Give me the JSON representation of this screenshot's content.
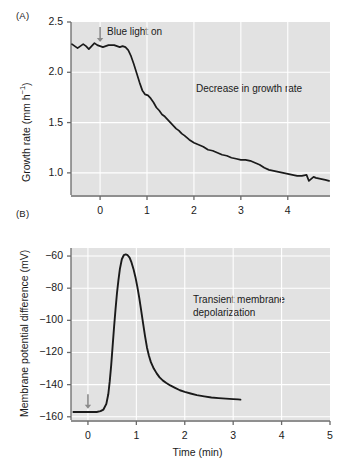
{
  "figure": {
    "panel_a_label": "(A)",
    "panel_b_label": "(B)",
    "shared_xlabel": "Time (min)"
  },
  "chart_data": [
    {
      "type": "line",
      "panel": "(A)",
      "title": "",
      "xlabel": "",
      "ylabel": "Growth rate (mm h−1)",
      "ylabel_display": "Growth rate (mm h",
      "ylabel_sup": "−1",
      "ylabel_tail": ")",
      "xlim": [
        -0.62,
        4.9
      ],
      "ylim": [
        0.78,
        2.5
      ],
      "xticks": [
        0,
        1,
        2,
        3,
        4
      ],
      "xticklabels": [
        "0",
        "1",
        "2",
        "3",
        "4"
      ],
      "yticks": [
        1.0,
        1.5,
        2.0,
        2.5
      ],
      "yticklabels": [
        "1.0",
        "1.5",
        "2.0",
        "2.5"
      ],
      "grid": true,
      "grid_color": "#ffffff",
      "plot_bg": "#e2e2e2",
      "line_color": "#1a1a1a",
      "annotations": [
        {
          "text": "Blue light on",
          "x": 0.08,
          "y": 2.42
        },
        {
          "text": "Decrease in growth rate",
          "x": 2.0,
          "y": 1.78
        }
      ],
      "arrow": {
        "x": 0.0,
        "y_top": 2.45,
        "y_bottom": 2.3,
        "color": "#8a8a8a"
      },
      "x": [
        -0.6,
        -0.54,
        -0.48,
        -0.42,
        -0.36,
        -0.3,
        -0.24,
        -0.18,
        -0.12,
        -0.06,
        0.0,
        0.06,
        0.12,
        0.18,
        0.24,
        0.3,
        0.36,
        0.42,
        0.48,
        0.54,
        0.6,
        0.66,
        0.72,
        0.78,
        0.84,
        0.9,
        0.96,
        1.02,
        1.08,
        1.14,
        1.2,
        1.26,
        1.32,
        1.38,
        1.44,
        1.5,
        1.56,
        1.62,
        1.68,
        1.74,
        1.8,
        1.9,
        2.0,
        2.1,
        2.2,
        2.3,
        2.4,
        2.5,
        2.6,
        2.7,
        2.8,
        2.9,
        3.0,
        3.1,
        3.2,
        3.3,
        3.4,
        3.5,
        3.6,
        3.7,
        3.8,
        3.9,
        4.0,
        4.1,
        4.2,
        4.3,
        4.4,
        4.45,
        4.5,
        4.55,
        4.6,
        4.7,
        4.8,
        4.88
      ],
      "y": [
        2.28,
        2.26,
        2.24,
        2.26,
        2.28,
        2.26,
        2.23,
        2.26,
        2.29,
        2.27,
        2.26,
        2.25,
        2.26,
        2.27,
        2.27,
        2.27,
        2.26,
        2.25,
        2.26,
        2.25,
        2.22,
        2.16,
        2.08,
        1.99,
        1.9,
        1.82,
        1.78,
        1.77,
        1.74,
        1.7,
        1.65,
        1.62,
        1.58,
        1.56,
        1.53,
        1.5,
        1.47,
        1.44,
        1.42,
        1.39,
        1.37,
        1.33,
        1.3,
        1.28,
        1.26,
        1.23,
        1.22,
        1.2,
        1.18,
        1.17,
        1.15,
        1.14,
        1.13,
        1.13,
        1.12,
        1.1,
        1.08,
        1.05,
        1.03,
        1.02,
        1.01,
        1.0,
        0.99,
        0.98,
        0.97,
        0.97,
        0.98,
        0.92,
        0.94,
        0.96,
        0.95,
        0.94,
        0.93,
        0.92
      ]
    },
    {
      "type": "line",
      "panel": "(B)",
      "title": "",
      "xlabel": "Time (min)",
      "ylabel": "Membrane potential difference (mV)",
      "xlim": [
        -0.35,
        5.0
      ],
      "ylim": [
        -162,
        -55
      ],
      "xticks": [
        0,
        1,
        2,
        3,
        4,
        5
      ],
      "xticklabels": [
        "0",
        "1",
        "2",
        "3",
        "4",
        "5"
      ],
      "yticks": [
        -160,
        -140,
        -120,
        -100,
        -80,
        -60
      ],
      "yticklabels": [
        "−160",
        "−140",
        "−120",
        "−100",
        "−80",
        "−60"
      ],
      "grid": true,
      "grid_color": "#ffffff",
      "plot_bg": "#e2e2e2",
      "line_color": "#1a1a1a",
      "annotations": [
        {
          "text": "Transient membrane\ndepolarization",
          "x": 1.9,
          "y": -88
        }
      ],
      "arrow": {
        "x": 0.0,
        "y_top": -146,
        "y_bottom": -155,
        "color": "#8a8a8a"
      },
      "x": [
        -0.3,
        -0.22,
        -0.14,
        -0.06,
        0.02,
        0.1,
        0.18,
        0.26,
        0.32,
        0.38,
        0.42,
        0.45,
        0.48,
        0.51,
        0.54,
        0.57,
        0.6,
        0.63,
        0.66,
        0.7,
        0.74,
        0.78,
        0.82,
        0.86,
        0.9,
        0.94,
        0.98,
        1.02,
        1.06,
        1.1,
        1.14,
        1.18,
        1.22,
        1.26,
        1.3,
        1.36,
        1.42,
        1.48,
        1.55,
        1.62,
        1.7,
        1.8,
        1.9,
        2.0,
        2.12,
        2.25,
        2.4,
        2.55,
        2.7,
        2.85,
        3.0,
        3.1,
        3.15
      ],
      "y": [
        -157,
        -157,
        -157,
        -157,
        -157,
        -157,
        -157,
        -156.5,
        -155.5,
        -152,
        -146,
        -138,
        -128,
        -116,
        -104,
        -93,
        -83,
        -75,
        -68,
        -62,
        -59.5,
        -59,
        -59.5,
        -61,
        -64,
        -68,
        -73,
        -79,
        -86,
        -94,
        -102,
        -110,
        -117,
        -122,
        -126,
        -130,
        -133,
        -135.5,
        -137.5,
        -139,
        -140.5,
        -142,
        -143.5,
        -144.5,
        -145.5,
        -146.5,
        -147.3,
        -148,
        -148.4,
        -148.7,
        -149,
        -149.2,
        -149.3
      ]
    }
  ]
}
